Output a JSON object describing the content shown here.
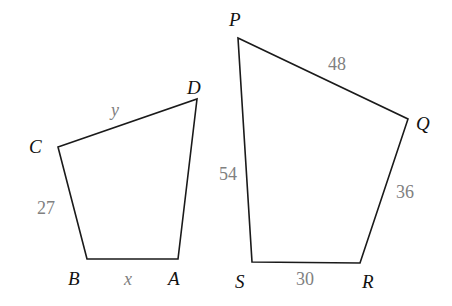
{
  "diagram": {
    "type": "similar-quadrilaterals",
    "colors": {
      "edge": "#1a1a1a",
      "vertex_label": "#111111",
      "side_label": "#808080",
      "background": "#ffffff"
    },
    "quad_left": {
      "name": "ABCD",
      "vertices": {
        "A": {
          "label": "A",
          "x": 178,
          "y": 259
        },
        "B": {
          "label": "B",
          "x": 87,
          "y": 259
        },
        "C": {
          "label": "C",
          "x": 58,
          "y": 147
        },
        "D": {
          "label": "D",
          "x": 197,
          "y": 99
        }
      },
      "sides": {
        "BC": {
          "label": "27"
        },
        "CD": {
          "label": "y"
        },
        "BA": {
          "label": "x"
        }
      }
    },
    "quad_right": {
      "name": "PQRS",
      "vertices": {
        "P": {
          "label": "P",
          "x": 238,
          "y": 38
        },
        "Q": {
          "label": "Q",
          "x": 408,
          "y": 119
        },
        "R": {
          "label": "R",
          "x": 360,
          "y": 263
        },
        "S": {
          "label": "S",
          "x": 252,
          "y": 262
        }
      },
      "sides": {
        "PQ": {
          "label": "48"
        },
        "QR": {
          "label": "36"
        },
        "SR": {
          "label": "30"
        },
        "PS": {
          "label": "54"
        }
      }
    }
  }
}
